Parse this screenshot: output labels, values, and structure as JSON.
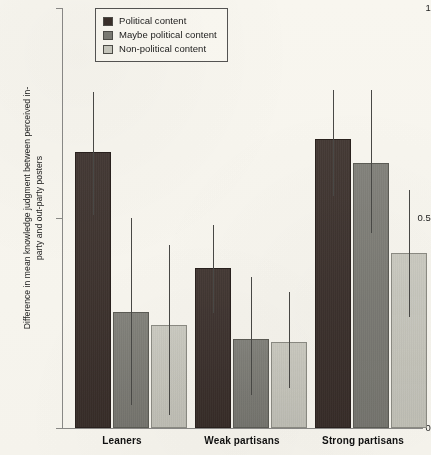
{
  "chart_data": {
    "type": "bar",
    "title": "",
    "subtitle": "",
    "xlabel": "",
    "ylabel": "Difference in mean knowledge judgment between perceived in-party and out-party posters",
    "categories": [
      "Leaners",
      "Weak partisans",
      "Strong partisans"
    ],
    "ylim": [
      0,
      1
    ],
    "yticks": [
      0,
      0.5,
      1
    ],
    "ytick_labels": [
      "0",
      "0.5",
      "1"
    ],
    "grid": false,
    "legend_position": "top-left",
    "legend_entries": [
      "Political content",
      "Maybe political content",
      "Non-political content"
    ],
    "series": [
      {
        "name": "Political content",
        "color": "#3b302c",
        "values": [
          0.657,
          0.381,
          0.688
        ],
        "error_low": [
          0.507,
          0.274,
          0.552
        ],
        "error_high": [
          0.8,
          0.483,
          0.805
        ]
      },
      {
        "name": "Maybe political content",
        "color": "#7d7d78",
        "values": [
          0.276,
          0.212,
          0.631
        ],
        "error_low": [
          0.055,
          0.079,
          0.464
        ],
        "error_high": [
          0.5,
          0.36,
          0.805
        ]
      },
      {
        "name": "Non-political content",
        "color": "#cbcbc4",
        "values": [
          0.245,
          0.205,
          0.417
        ],
        "error_low": [
          0.031,
          0.095,
          0.264
        ],
        "error_high": [
          0.436,
          0.324,
          0.567
        ]
      }
    ]
  },
  "axis": {
    "y_title": "Difference in mean knowledge judgment between perceived in-party and out-party posters",
    "y_tick_top": "1",
    "y_tick_mid": "0.5",
    "y_tick_bottom": "0"
  },
  "legend": {
    "items": [
      {
        "label": "Political content",
        "color": "#3b302c"
      },
      {
        "label": "Maybe political content",
        "color": "#7d7d78"
      },
      {
        "label": "Non-political content",
        "color": "#cbcbc4"
      }
    ]
  },
  "x_groups": [
    {
      "label": "Leaners"
    },
    {
      "label": "Weak partisans"
    },
    {
      "label": "Strong partisans"
    }
  ]
}
